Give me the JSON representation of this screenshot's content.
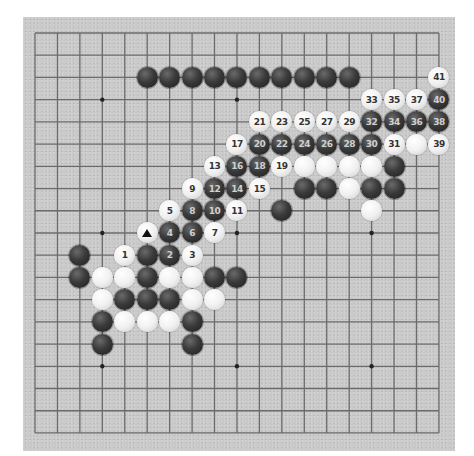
{
  "diagram": {
    "type": "go-board",
    "size": 19,
    "colors": {
      "board": "#c9c9c9",
      "grid": "#6b6b6b",
      "star": "#222222",
      "black_stone": "#333333",
      "white_stone": "#f2f2f2"
    },
    "star_points": [
      [
        3,
        3
      ],
      [
        9,
        3
      ],
      [
        15,
        3
      ],
      [
        3,
        9
      ],
      [
        9,
        9
      ],
      [
        15,
        9
      ],
      [
        3,
        15
      ],
      [
        9,
        15
      ],
      [
        15,
        15
      ]
    ],
    "stones": [
      {
        "c": 5,
        "r": 2,
        "color": "black",
        "label": ""
      },
      {
        "c": 6,
        "r": 2,
        "color": "black",
        "label": ""
      },
      {
        "c": 7,
        "r": 2,
        "color": "black",
        "label": ""
      },
      {
        "c": 8,
        "r": 2,
        "color": "black",
        "label": ""
      },
      {
        "c": 9,
        "r": 2,
        "color": "black",
        "label": ""
      },
      {
        "c": 10,
        "r": 2,
        "color": "black",
        "label": ""
      },
      {
        "c": 11,
        "r": 2,
        "color": "black",
        "label": ""
      },
      {
        "c": 12,
        "r": 2,
        "color": "black",
        "label": ""
      },
      {
        "c": 13,
        "r": 2,
        "color": "black",
        "label": ""
      },
      {
        "c": 14,
        "r": 2,
        "color": "black",
        "label": ""
      },
      {
        "c": 18,
        "r": 2,
        "color": "white",
        "label": "41"
      },
      {
        "c": 15,
        "r": 3,
        "color": "white",
        "label": "33"
      },
      {
        "c": 16,
        "r": 3,
        "color": "white",
        "label": "35"
      },
      {
        "c": 17,
        "r": 3,
        "color": "white",
        "label": "37"
      },
      {
        "c": 18,
        "r": 3,
        "color": "black",
        "label": "40"
      },
      {
        "c": 10,
        "r": 4,
        "color": "white",
        "label": "21"
      },
      {
        "c": 11,
        "r": 4,
        "color": "white",
        "label": "23"
      },
      {
        "c": 12,
        "r": 4,
        "color": "white",
        "label": "25"
      },
      {
        "c": 13,
        "r": 4,
        "color": "white",
        "label": "27"
      },
      {
        "c": 14,
        "r": 4,
        "color": "white",
        "label": "29"
      },
      {
        "c": 15,
        "r": 4,
        "color": "black",
        "label": "32"
      },
      {
        "c": 16,
        "r": 4,
        "color": "black",
        "label": "34"
      },
      {
        "c": 17,
        "r": 4,
        "color": "black",
        "label": "36"
      },
      {
        "c": 18,
        "r": 4,
        "color": "black",
        "label": "38"
      },
      {
        "c": 9,
        "r": 5,
        "color": "white",
        "label": "17"
      },
      {
        "c": 10,
        "r": 5,
        "color": "black",
        "label": "20"
      },
      {
        "c": 11,
        "r": 5,
        "color": "black",
        "label": "22"
      },
      {
        "c": 12,
        "r": 5,
        "color": "black",
        "label": "24"
      },
      {
        "c": 13,
        "r": 5,
        "color": "black",
        "label": "26"
      },
      {
        "c": 14,
        "r": 5,
        "color": "black",
        "label": "28"
      },
      {
        "c": 15,
        "r": 5,
        "color": "black",
        "label": "30"
      },
      {
        "c": 16,
        "r": 5,
        "color": "white",
        "label": "31"
      },
      {
        "c": 17,
        "r": 5,
        "color": "white",
        "label": ""
      },
      {
        "c": 18,
        "r": 5,
        "color": "white",
        "label": "39"
      },
      {
        "c": 8,
        "r": 6,
        "color": "white",
        "label": "13"
      },
      {
        "c": 9,
        "r": 6,
        "color": "black",
        "label": "16"
      },
      {
        "c": 10,
        "r": 6,
        "color": "black",
        "label": "18"
      },
      {
        "c": 11,
        "r": 6,
        "color": "white",
        "label": "19"
      },
      {
        "c": 12,
        "r": 6,
        "color": "white",
        "label": ""
      },
      {
        "c": 13,
        "r": 6,
        "color": "white",
        "label": ""
      },
      {
        "c": 14,
        "r": 6,
        "color": "white",
        "label": ""
      },
      {
        "c": 15,
        "r": 6,
        "color": "white",
        "label": ""
      },
      {
        "c": 16,
        "r": 6,
        "color": "black",
        "label": ""
      },
      {
        "c": 7,
        "r": 7,
        "color": "white",
        "label": "9"
      },
      {
        "c": 8,
        "r": 7,
        "color": "black",
        "label": "12"
      },
      {
        "c": 9,
        "r": 7,
        "color": "black",
        "label": "14"
      },
      {
        "c": 10,
        "r": 7,
        "color": "white",
        "label": "15"
      },
      {
        "c": 12,
        "r": 7,
        "color": "black",
        "label": ""
      },
      {
        "c": 13,
        "r": 7,
        "color": "black",
        "label": ""
      },
      {
        "c": 14,
        "r": 7,
        "color": "white",
        "label": ""
      },
      {
        "c": 15,
        "r": 7,
        "color": "black",
        "label": ""
      },
      {
        "c": 16,
        "r": 7,
        "color": "black",
        "label": ""
      },
      {
        "c": 6,
        "r": 8,
        "color": "white",
        "label": "5"
      },
      {
        "c": 7,
        "r": 8,
        "color": "black",
        "label": "8"
      },
      {
        "c": 8,
        "r": 8,
        "color": "black",
        "label": "10"
      },
      {
        "c": 9,
        "r": 8,
        "color": "white",
        "label": "11"
      },
      {
        "c": 11,
        "r": 8,
        "color": "black",
        "label": ""
      },
      {
        "c": 15,
        "r": 8,
        "color": "white",
        "label": ""
      },
      {
        "c": 5,
        "r": 9,
        "color": "white",
        "label": "",
        "marker": "triangle"
      },
      {
        "c": 6,
        "r": 9,
        "color": "black",
        "label": "4"
      },
      {
        "c": 7,
        "r": 9,
        "color": "black",
        "label": "6"
      },
      {
        "c": 8,
        "r": 9,
        "color": "white",
        "label": "7"
      },
      {
        "c": 2,
        "r": 10,
        "color": "black",
        "label": ""
      },
      {
        "c": 4,
        "r": 10,
        "color": "white",
        "label": "1"
      },
      {
        "c": 5,
        "r": 10,
        "color": "black",
        "label": ""
      },
      {
        "c": 6,
        "r": 10,
        "color": "black",
        "label": "2"
      },
      {
        "c": 7,
        "r": 10,
        "color": "white",
        "label": "3"
      },
      {
        "c": 2,
        "r": 11,
        "color": "black",
        "label": ""
      },
      {
        "c": 3,
        "r": 11,
        "color": "white",
        "label": ""
      },
      {
        "c": 4,
        "r": 11,
        "color": "white",
        "label": ""
      },
      {
        "c": 5,
        "r": 11,
        "color": "black",
        "label": ""
      },
      {
        "c": 6,
        "r": 11,
        "color": "white",
        "label": ""
      },
      {
        "c": 7,
        "r": 11,
        "color": "white",
        "label": ""
      },
      {
        "c": 8,
        "r": 11,
        "color": "black",
        "label": ""
      },
      {
        "c": 9,
        "r": 11,
        "color": "black",
        "label": ""
      },
      {
        "c": 3,
        "r": 12,
        "color": "white",
        "label": ""
      },
      {
        "c": 4,
        "r": 12,
        "color": "black",
        "label": ""
      },
      {
        "c": 5,
        "r": 12,
        "color": "black",
        "label": ""
      },
      {
        "c": 6,
        "r": 12,
        "color": "black",
        "label": ""
      },
      {
        "c": 7,
        "r": 12,
        "color": "white",
        "label": ""
      },
      {
        "c": 8,
        "r": 12,
        "color": "white",
        "label": ""
      },
      {
        "c": 3,
        "r": 13,
        "color": "black",
        "label": ""
      },
      {
        "c": 4,
        "r": 13,
        "color": "white",
        "label": ""
      },
      {
        "c": 5,
        "r": 13,
        "color": "white",
        "label": ""
      },
      {
        "c": 6,
        "r": 13,
        "color": "white",
        "label": ""
      },
      {
        "c": 7,
        "r": 13,
        "color": "black",
        "label": ""
      },
      {
        "c": 3,
        "r": 14,
        "color": "black",
        "label": ""
      },
      {
        "c": 7,
        "r": 14,
        "color": "black",
        "label": ""
      }
    ]
  }
}
